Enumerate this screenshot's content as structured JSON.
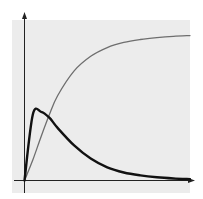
{
  "chart_data": {
    "type": "line",
    "title": "",
    "xlabel": "",
    "ylabel": "",
    "grid": false,
    "legend": null,
    "background_color": "#ececec",
    "axes": {
      "x_arrow": true,
      "y_arrow": true,
      "ticks": false
    },
    "x": [
      0,
      0.05,
      0.1,
      0.15,
      0.2,
      0.3,
      0.4,
      0.5,
      0.6,
      0.7,
      0.8,
      0.9,
      1.0
    ],
    "series": [
      {
        "name": "rising saturation curve",
        "color": "#6e6e6e",
        "stroke_width": 1.3,
        "values": [
          0,
          0.14,
          0.3,
          0.45,
          0.58,
          0.75,
          0.85,
          0.91,
          0.945,
          0.965,
          0.978,
          0.987,
          0.992
        ]
      },
      {
        "name": "peaked curve (rise and decay)",
        "color": "#111111",
        "stroke_width": 2.4,
        "values": [
          0,
          0.45,
          0.47,
          0.43,
          0.36,
          0.24,
          0.15,
          0.09,
          0.055,
          0.035,
          0.022,
          0.014,
          0.009
        ]
      }
    ],
    "xlim": [
      0,
      1
    ],
    "ylim": [
      0,
      1.03
    ]
  }
}
